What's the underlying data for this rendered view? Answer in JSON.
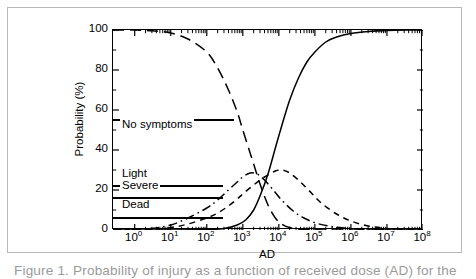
{
  "figure": {
    "caption": "Figure 1. Probability of injury as a function of received dose (AD) for the",
    "frame_color": "#b9b9b9"
  },
  "chart_data": {
    "type": "line",
    "title": "",
    "subtitle": "",
    "xlabel": "AD",
    "ylabel": "Probability (%)",
    "xscale": "log",
    "yscale": "linear",
    "xlim": [
      0.25,
      100000000
    ],
    "ylim": [
      0,
      100
    ],
    "grid": false,
    "legend_position": "inside-left",
    "xtick_labels": [
      "10⁰",
      "10¹",
      "10²",
      "10³",
      "10⁴",
      "10⁵",
      "10⁶",
      "10⁷",
      "10⁸"
    ],
    "xtick_values": [
      1,
      10,
      100,
      1000,
      10000,
      100000,
      1000000,
      10000000,
      100000000
    ],
    "xtick_mantissas": [
      "10",
      "10",
      "10",
      "10",
      "10",
      "10",
      "10",
      "10",
      "10"
    ],
    "xtick_exponents": [
      "0",
      "1",
      "2",
      "3",
      "4",
      "5",
      "6",
      "7",
      "8"
    ],
    "ytick_labels": [
      "0",
      "20",
      "40",
      "60",
      "80",
      "100"
    ],
    "ytick_values": [
      0,
      20,
      40,
      60,
      80,
      100
    ],
    "series": [
      {
        "name": "No symptoms",
        "style": "long-dash",
        "legend_level": 55,
        "legend_label_y": 52,
        "legend_rule_width": 121,
        "points": [
          [
            0.25,
            100
          ],
          [
            1,
            100
          ],
          [
            3,
            99.6
          ],
          [
            10,
            98.5
          ],
          [
            30,
            95.5
          ],
          [
            100,
            89
          ],
          [
            200,
            81
          ],
          [
            400,
            70
          ],
          [
            700,
            59
          ],
          [
            1000,
            50
          ],
          [
            1500,
            40
          ],
          [
            2000,
            33
          ],
          [
            3000,
            23
          ],
          [
            5000,
            12.5
          ],
          [
            8000,
            6
          ],
          [
            12000,
            3
          ],
          [
            20000,
            1.2
          ],
          [
            50000,
            0.3
          ],
          [
            200000,
            0.05
          ],
          [
            100000000,
            0
          ]
        ]
      },
      {
        "name": "Light",
        "style": "short-dash",
        "legend_level": 22,
        "legend_label_y": 27.5,
        "legend_rule_width": 110,
        "points": [
          [
            0.25,
            0
          ],
          [
            1,
            0.1
          ],
          [
            3,
            0.4
          ],
          [
            10,
            1.2
          ],
          [
            30,
            3
          ],
          [
            100,
            6
          ],
          [
            200,
            8.5
          ],
          [
            400,
            12
          ],
          [
            700,
            15.5
          ],
          [
            1000,
            18
          ],
          [
            2000,
            22.5
          ],
          [
            4000,
            26.5
          ],
          [
            8000,
            29.5
          ],
          [
            12000,
            30
          ],
          [
            20000,
            28.5
          ],
          [
            40000,
            24
          ],
          [
            80000,
            18.5
          ],
          [
            150000,
            13.5
          ],
          [
            400000,
            8
          ],
          [
            1000000,
            4.5
          ],
          [
            3000000,
            2
          ],
          [
            10000000,
            0.8
          ],
          [
            40000000,
            0.2
          ],
          [
            100000000,
            0
          ]
        ]
      },
      {
        "name": "Severe",
        "style": "dash-dot",
        "legend_level": 16,
        "legend_label_y": 21.5,
        "legend_rule_width": 110,
        "points": [
          [
            0.25,
            0
          ],
          [
            1,
            0.2
          ],
          [
            3,
            0.8
          ],
          [
            10,
            2.5
          ],
          [
            30,
            6
          ],
          [
            100,
            11
          ],
          [
            200,
            15
          ],
          [
            400,
            20
          ],
          [
            700,
            24
          ],
          [
            1000,
            26.5
          ],
          [
            1600,
            28.5
          ],
          [
            2500,
            28
          ],
          [
            4000,
            25
          ],
          [
            7000,
            20
          ],
          [
            12000,
            15
          ],
          [
            25000,
            9.5
          ],
          [
            50000,
            6
          ],
          [
            120000,
            3.2
          ],
          [
            400000,
            1.4
          ],
          [
            1500000,
            0.5
          ],
          [
            6000000,
            0.15
          ],
          [
            100000000,
            0
          ]
        ]
      },
      {
        "name": "Dead",
        "style": "solid",
        "legend_level": 6,
        "legend_label_y": 12,
        "legend_rule_width": 110,
        "points": [
          [
            0.25,
            0
          ],
          [
            10,
            0
          ],
          [
            100,
            0.2
          ],
          [
            300,
            0.8
          ],
          [
            700,
            2.5
          ],
          [
            1200,
            5
          ],
          [
            2000,
            10
          ],
          [
            3000,
            17
          ],
          [
            5000,
            28
          ],
          [
            8000,
            41
          ],
          [
            12000,
            52
          ],
          [
            20000,
            65
          ],
          [
            35000,
            76
          ],
          [
            60000,
            84
          ],
          [
            100000,
            89
          ],
          [
            200000,
            94
          ],
          [
            400000,
            96.5
          ],
          [
            1000000,
            98.3
          ],
          [
            3000000,
            99.3
          ],
          [
            10000000,
            99.8
          ],
          [
            50000000,
            100
          ],
          [
            100000000,
            100
          ]
        ]
      }
    ]
  }
}
